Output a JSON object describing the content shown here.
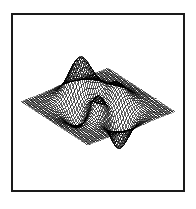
{
  "figure": {
    "title": "",
    "background_color": "#ffffff",
    "frame_color": "#1a1a1a",
    "frame_width_px": 2,
    "frame_left_px": 11,
    "frame_top_px": 13,
    "frame_width_total_px": 174,
    "frame_height_total_px": 179
  },
  "chart_data": {
    "type": "line",
    "render_style": "wireframe-mesh-3d",
    "title": "",
    "subtitle": "",
    "xlabel": "",
    "ylabel": "",
    "zlabel": "",
    "legend": [],
    "legend_position": "none",
    "grid": false,
    "axes_visible": false,
    "tick_labels_x": [],
    "tick_labels_y": [],
    "tick_labels_z": [],
    "surface_function": "peaks",
    "formula": "z = 3*(1-x)^2*exp(-x^2-(y+1)^2) - 10*(x/5 - x^3 - y^5)*exp(-x^2-y^2) - (1/3)*exp(-(x+1)^2 - y^2)",
    "xlim": [
      -3,
      3
    ],
    "ylim": [
      -3,
      3
    ],
    "zlim": [
      -6.5,
      8.1
    ],
    "grid_rows": 49,
    "grid_cols": 49,
    "mesh_color": "#000000",
    "mesh_line_width": 0.38,
    "surface_fill": "#ffffff",
    "view_azimuth_deg": -37.5,
    "view_elevation_deg": 30,
    "features": [
      {
        "name": "primary-peak",
        "x": -0.01,
        "y": 1.58,
        "z": 8.1,
        "screen_x": 75,
        "screen_y": 61
      },
      {
        "name": "secondary-bump",
        "x": 1.3,
        "y": 0.0,
        "z": 3.78,
        "screen_x": 120,
        "screen_y": 82
      },
      {
        "name": "central-depression",
        "x": -0.46,
        "y": -0.63,
        "z": -3.05,
        "screen_x": 100,
        "screen_y": 105
      },
      {
        "name": "deep-trough",
        "x": 0.23,
        "y": -1.63,
        "z": -6.55,
        "screen_x": 110,
        "screen_y": 150
      }
    ],
    "mesh_extent_screen": {
      "left_point": [
        22,
        105
      ],
      "right_point": [
        175,
        98
      ],
      "top_point": [
        75,
        60
      ],
      "bottom_point": [
        112,
        152
      ]
    }
  }
}
